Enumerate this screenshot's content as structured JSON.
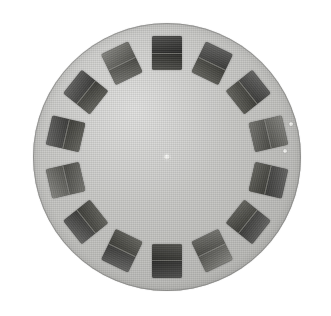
{
  "scene": {
    "title": "View-Master stereoscopic reel",
    "description": "A circular light-gray cardboard picture reel photographed flat against a plain white background.",
    "background_color": "#ffffff",
    "width": 331,
    "height": 316
  },
  "disc": {
    "name": "picture-reel-disc",
    "shape": "circle",
    "center_x": 167,
    "center_y": 157,
    "radius": 134,
    "fill_color": "#c3c3c0",
    "rim_color": "#78787 6",
    "material": "cardboard",
    "texture": "fine paper grain"
  },
  "hub": {
    "name": "center-hub",
    "center_x": 167,
    "center_y": 157,
    "diameter": 6,
    "color": "#f2f2ee",
    "label": "center hub hole"
  },
  "slides": {
    "count": 14,
    "angular_step_degrees": 25.7,
    "orbit_radius": 104,
    "slide_width": 30,
    "slide_height": 34,
    "frames_per_slide": 2,
    "frame_colors": [
      "#4e4e4c",
      "#56564f"
    ],
    "items": [
      {
        "index": 1,
        "angle_degrees": 0,
        "clock_position": "12:00",
        "tone": "dark"
      },
      {
        "index": 2,
        "angle_degrees": 25.7,
        "clock_position": "12:51",
        "tone": "mid"
      },
      {
        "index": 3,
        "angle_degrees": 51.4,
        "clock_position": "1:43",
        "tone": "mid"
      },
      {
        "index": 4,
        "angle_degrees": 77.1,
        "clock_position": "2:34",
        "tone": "light"
      },
      {
        "index": 5,
        "angle_degrees": 102.9,
        "clock_position": "3:26",
        "tone": "mid"
      },
      {
        "index": 6,
        "angle_degrees": 128.6,
        "clock_position": "4:17",
        "tone": "mid"
      },
      {
        "index": 7,
        "angle_degrees": 154.3,
        "clock_position": "5:09",
        "tone": "light"
      },
      {
        "index": 8,
        "angle_degrees": 180,
        "clock_position": "6:00",
        "tone": "dark"
      },
      {
        "index": 9,
        "angle_degrees": 205.7,
        "clock_position": "6:51",
        "tone": "mid"
      },
      {
        "index": 10,
        "angle_degrees": 231.4,
        "clock_position": "7:43",
        "tone": "mid"
      },
      {
        "index": 11,
        "angle_degrees": 257.1,
        "clock_position": "8:34",
        "tone": "light"
      },
      {
        "index": 12,
        "angle_degrees": 282.9,
        "clock_position": "9:26",
        "tone": "mid"
      },
      {
        "index": 13,
        "angle_degrees": 308.6,
        "clock_position": "10:17",
        "tone": "mid"
      },
      {
        "index": 14,
        "angle_degrees": 334.3,
        "clock_position": "11:09",
        "tone": "light"
      }
    ]
  },
  "notches": {
    "name": "index-notches",
    "color": "#f4f4f1",
    "items": [
      {
        "index": 1,
        "x": 291,
        "y": 124,
        "diameter": 4,
        "label": "upper right index notch"
      },
      {
        "index": 2,
        "x": 285,
        "y": 151,
        "diameter": 4,
        "label": "right index notch"
      }
    ]
  }
}
